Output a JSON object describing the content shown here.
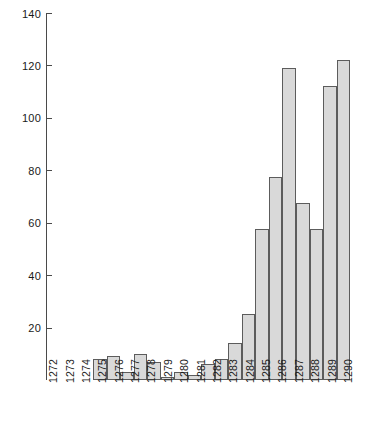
{
  "chart_data": {
    "type": "bar",
    "title": "",
    "subtitle": "",
    "xlabel": "",
    "ylabel": "",
    "categories": [
      "1272",
      "1273",
      "1274",
      "1275",
      "1276",
      "1277",
      "1278",
      "1279",
      "1280",
      "1281",
      "1282",
      "1283",
      "1284",
      "1285",
      "1286",
      "1287",
      "1288",
      "1289",
      "1290"
    ],
    "values": [
      8,
      9,
      3,
      10,
      7,
      1,
      3,
      2,
      6,
      8,
      14,
      25,
      57.5,
      77.5,
      119,
      67.5,
      57.5,
      112,
      122
    ],
    "series": [
      {
        "name": "",
        "values": [
          8,
          9,
          3,
          10,
          7,
          1,
          3,
          2,
          6,
          8,
          14,
          25,
          57.5,
          77.5,
          119,
          67.5,
          57.5,
          112,
          122
        ]
      }
    ],
    "ylim": [
      0,
      140
    ],
    "yticks": [
      0,
      20,
      40,
      60,
      80,
      100,
      120,
      140
    ],
    "ytick_labels": [
      "",
      "20",
      "40",
      "60",
      "80",
      "100",
      "120",
      "140"
    ],
    "xlim_labels": [
      "1272",
      "1290"
    ],
    "grid": false,
    "legend": null,
    "legend_position": "none",
    "bar_fill": "#d9d9d9",
    "bar_edge": "#5c5c5c",
    "axis_color": "#4a4a4a",
    "background": "#ffffff"
  },
  "caption": {
    "text": ""
  }
}
